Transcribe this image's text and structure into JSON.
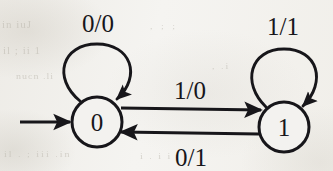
{
  "diagram": {
    "type": "mealy-state-transition-diagram",
    "ink_color": "#17161a",
    "paper_color": "#f3f2ef",
    "states": [
      {
        "id": "s0",
        "label": "0",
        "cx": 97,
        "cy": 122,
        "r": 25,
        "initial": true
      },
      {
        "id": "s1",
        "label": "1",
        "cx": 284,
        "cy": 127,
        "r": 25,
        "initial": false
      }
    ],
    "transitions": [
      {
        "id": "t-self-0",
        "from": "s0",
        "to": "s0",
        "label": "0/0",
        "kind": "self-loop",
        "label_x": 98,
        "label_y": 32
      },
      {
        "id": "t-self-1",
        "from": "s1",
        "to": "s1",
        "label": "1/1",
        "kind": "self-loop",
        "label_x": 283,
        "label_y": 35
      },
      {
        "id": "t-0-to-1",
        "from": "s0",
        "to": "s1",
        "label": "1/0",
        "kind": "straight",
        "label_x": 190,
        "label_y": 99
      },
      {
        "id": "t-1-to-0",
        "from": "s1",
        "to": "s0",
        "label": "0/1",
        "kind": "straight",
        "label_x": 191,
        "label_y": 166
      }
    ],
    "start_arrow": {
      "id": "start-arrow",
      "x1": 20,
      "y1": 122,
      "x2": 70,
      "y2": 122
    },
    "ghost_text": {
      "a": "in  iuJ",
      "b": "il ;  ii 1",
      "c": "nucn  .li",
      "d": "il . ;  iii  .in",
      "e": ",  ; ;",
      "f": ",  .i",
      "g": "i .  i i"
    }
  }
}
